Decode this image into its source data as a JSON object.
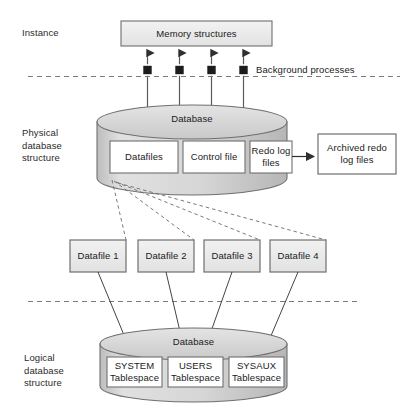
{
  "diagram": {
    "colors": {
      "box_fill": "#ededed",
      "box_stroke": "#6f6f6f",
      "cylinder_fill": "#d4d4d4",
      "cylinder_stroke": "#6f6f6f",
      "inner_box_fill": "#ffffff",
      "line": "#3a3a3a",
      "dashed": "#6b6b6b",
      "text": "#1a1a1a"
    },
    "side_labels": [
      {
        "name": "instance",
        "text": "Instance"
      },
      {
        "name": "physical-database-structure",
        "text": "Physical\ndatabase\nstructure"
      },
      {
        "name": "logical-database-structure",
        "text": "Logical\ndatabase\nstructure"
      }
    ],
    "instance": {
      "memory_structures": "Memory structures",
      "background_processes": "Background processes",
      "process_count": 4
    },
    "physical": {
      "cylinder_label": "Database",
      "components": [
        {
          "name": "datafiles",
          "text": "Datafiles"
        },
        {
          "name": "control-file",
          "text": "Control file"
        },
        {
          "name": "redo-log-files",
          "text": "Redo log\nfiles"
        }
      ],
      "archived": {
        "name": "archived-redo-log-files",
        "text": "Archived redo\nlog files"
      }
    },
    "datafiles": [
      {
        "name": "datafile-1",
        "text": "Datafile 1"
      },
      {
        "name": "datafile-2",
        "text": "Datafile 2"
      },
      {
        "name": "datafile-3",
        "text": "Datafile 3"
      },
      {
        "name": "datafile-4",
        "text": "Datafile 4"
      }
    ],
    "logical": {
      "cylinder_label": "Database",
      "tablespaces": [
        {
          "name": "system-tablespace",
          "text": "SYSTEM\nTablespace"
        },
        {
          "name": "users-tablespace",
          "text": "USERS\nTablespace"
        },
        {
          "name": "sysaux-tablespace",
          "text": "SYSAUX\nTablespace"
        }
      ]
    }
  }
}
